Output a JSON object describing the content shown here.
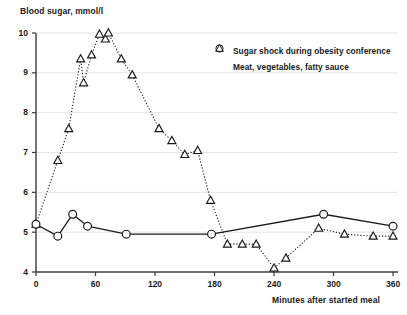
{
  "chart_data": {
    "type": "line",
    "title": "",
    "ylabel": "Blood sugar, mmol/l",
    "xlabel": "Minutes after started meal",
    "xlim": [
      0,
      365
    ],
    "ylim": [
      4,
      10
    ],
    "xticks": [
      0,
      60,
      120,
      180,
      240,
      300,
      360
    ],
    "yticks": [
      4,
      5,
      6,
      7,
      8,
      9,
      10
    ],
    "grid": "horizontal",
    "legend_position": "top-right",
    "series": [
      {
        "name": "Sugar shock during obesity conference",
        "marker": "triangle",
        "line_style": "dotted",
        "points": [
          [
            0,
            5.2
          ],
          [
            22,
            6.8
          ],
          [
            33,
            7.6
          ],
          [
            45,
            9.35
          ],
          [
            48,
            8.75
          ],
          [
            56,
            9.45
          ],
          [
            64,
            9.97
          ],
          [
            70,
            9.85
          ],
          [
            73,
            10.0
          ],
          [
            86,
            9.35
          ],
          [
            97,
            8.95
          ],
          [
            124,
            7.6
          ],
          [
            137,
            7.3
          ],
          [
            150,
            6.95
          ],
          [
            163,
            7.05
          ],
          [
            176,
            5.8
          ],
          [
            193,
            4.7
          ],
          [
            208,
            4.7
          ],
          [
            222,
            4.7
          ],
          [
            240,
            4.1
          ],
          [
            252,
            4.35
          ],
          [
            285,
            5.1
          ],
          [
            311,
            4.95
          ],
          [
            340,
            4.9
          ],
          [
            360,
            4.9
          ]
        ]
      },
      {
        "name": "Meat, vegetables, fatty sauce",
        "marker": "circle",
        "line_style": "solid",
        "points": [
          [
            0,
            5.2
          ],
          [
            22,
            4.9
          ],
          [
            37,
            5.45
          ],
          [
            52,
            5.15
          ],
          [
            91,
            4.95
          ],
          [
            177,
            4.95
          ],
          [
            290,
            5.45
          ],
          [
            360,
            5.15
          ]
        ]
      }
    ]
  },
  "legend": {
    "items": [
      {
        "marker": "triangle",
        "label": "Sugar shock during obesity conference"
      },
      {
        "marker": "circle",
        "label": "Meat, vegetables, fatty sauce"
      }
    ]
  },
  "axes": {
    "y_tick_labels": [
      "10",
      "9",
      "8",
      "7",
      "6",
      "5",
      "4"
    ],
    "x_tick_labels": [
      "0",
      "60",
      "120",
      "180",
      "240",
      "300",
      "360"
    ]
  },
  "colors": {
    "axis": "#3a3a3a",
    "grid": "#e4e4ea",
    "series_triangle": "#1a1a1a",
    "series_circle": "#1a1a1a",
    "text": "#1a1a1a",
    "background": "#ffffff"
  }
}
